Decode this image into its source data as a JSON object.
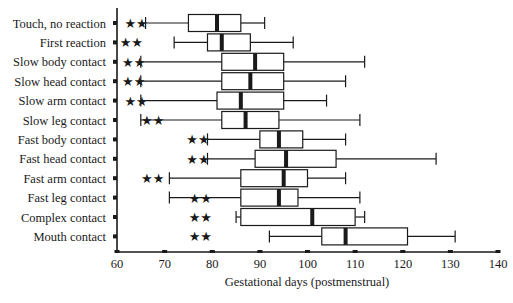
{
  "chart_data": {
    "type": "boxplot",
    "title": "",
    "xlabel": "Gestational days (postmenstrual)",
    "ylabel": "",
    "xlim": [
      60,
      140
    ],
    "xticks": [
      60,
      70,
      80,
      90,
      100,
      110,
      120,
      130,
      140
    ],
    "grid": false,
    "legend": null,
    "annotation": "** significance markers shown beside each category",
    "categories": [
      "Touch, no reaction",
      "First reaction",
      "Slow body contact",
      "Slow head contact",
      "Slow arm contact",
      "Slow leg contact",
      "Fast body contact",
      "Fast head contact",
      "Fast arm contact",
      "Fast leg contact",
      "Complex contact",
      "Mouth contact"
    ],
    "boxes": [
      {
        "label": "Touch, no reaction",
        "whisker_low": 66,
        "q1": 75,
        "median": 81,
        "q3": 86,
        "whisker_high": 91,
        "stars_x": 64
      },
      {
        "label": "First reaction",
        "whisker_low": 72,
        "q1": 79,
        "median": 82,
        "q3": 88,
        "whisker_high": 97,
        "stars_x": 63
      },
      {
        "label": "Slow body contact",
        "whisker_low": 65,
        "q1": 82,
        "median": 89,
        "q3": 95,
        "whisker_high": 112,
        "stars_x": 63.5
      },
      {
        "label": "Slow head contact",
        "whisker_low": 65,
        "q1": 82,
        "median": 88,
        "q3": 95,
        "whisker_high": 108,
        "stars_x": 63.5
      },
      {
        "label": "Slow arm contact",
        "whisker_low": 65,
        "q1": 81,
        "median": 86,
        "q3": 95,
        "whisker_high": 104,
        "stars_x": 64
      },
      {
        "label": "Slow leg contact",
        "whisker_low": 65,
        "q1": 82,
        "median": 87,
        "q3": 94,
        "whisker_high": 111,
        "stars_x": 67.5
      },
      {
        "label": "Fast body contact",
        "whisker_low": 79,
        "q1": 90,
        "median": 94,
        "q3": 99,
        "whisker_high": 108,
        "stars_x": 77
      },
      {
        "label": "Fast head contact",
        "whisker_low": 79,
        "q1": 89,
        "median": 95.5,
        "q3": 106,
        "whisker_high": 127,
        "stars_x": 77
      },
      {
        "label": "Fast arm contact",
        "whisker_low": 71,
        "q1": 86,
        "median": 95,
        "q3": 100,
        "whisker_high": 108,
        "stars_x": 67.5
      },
      {
        "label": "Fast leg contact",
        "whisker_low": 71,
        "q1": 86,
        "median": 94,
        "q3": 98,
        "whisker_high": 111,
        "stars_x": 77.5
      },
      {
        "label": "Complex contact",
        "whisker_low": 85,
        "q1": 86,
        "median": 101,
        "q3": 110,
        "whisker_high": 112,
        "stars_x": 77.5
      },
      {
        "label": "Mouth contact",
        "whisker_low": 92,
        "q1": 103,
        "median": 108,
        "q3": 121,
        "whisker_high": 131,
        "stars_x": 77.5
      }
    ],
    "marker": "★★"
  }
}
